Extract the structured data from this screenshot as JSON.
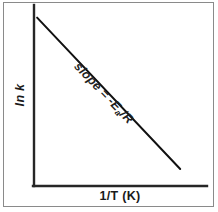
{
  "figure": {
    "kind": "arrhenius-plot",
    "background_color": "#ffffff",
    "frame_color": "#8a8a8a",
    "axis_color": "#262626",
    "line_color": "#111111",
    "text_color": "#1a1a1a",
    "y_axis_label": "ln k",
    "x_axis_label": "1/T (K)",
    "annotation": {
      "prefix": "slope = -E",
      "subscript": "a",
      "suffix": "/R",
      "full_text": "slope = -Ea/R",
      "rotation_deg": 46.4
    }
  },
  "chart_data": {
    "type": "line",
    "title": "",
    "subtitle": "",
    "xlabel": "1/T (K)",
    "ylabel": "ln k",
    "grid": false,
    "legend_position": "none",
    "axis_ticks": {
      "x": [],
      "y": []
    },
    "xlim": [
      0,
      1
    ],
    "ylim": [
      0,
      1
    ],
    "series": [
      {
        "name": "Arrhenius fit",
        "type": "line",
        "x": [
          0.018,
          0.845
        ],
        "y": [
          0.93,
          0.094
        ],
        "slope_label": "-Ea/R",
        "color": "#111111",
        "width_px": 2
      }
    ],
    "annotations": [
      {
        "text": "slope = -Ea/R",
        "x": 0.3,
        "y": 0.66,
        "rotation_deg": 46.4,
        "along_series": "Arrhenius fit"
      }
    ]
  }
}
